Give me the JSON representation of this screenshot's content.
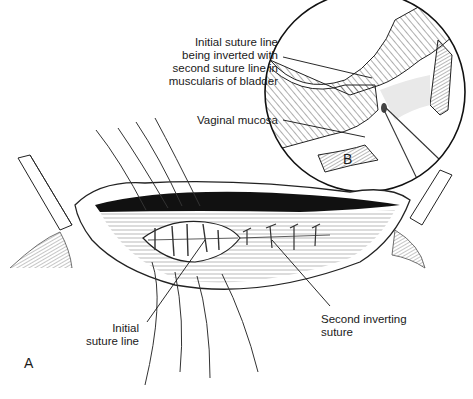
{
  "figure": {
    "panels": [
      {
        "id": "A",
        "label": "A"
      },
      {
        "id": "B",
        "label": "B"
      }
    ],
    "annotations": {
      "inverted_line": "Initial suture line\nbeing inverted with\nsecond suture line in\nmuscularis of bladder",
      "vaginal_mucosa": "Vaginal mucosa",
      "initial_suture": "Initial\nsuture line",
      "second_inverting": "Second inverting\nsuture"
    },
    "colors": {
      "ink": "#1a1a1a",
      "background": "#ffffff"
    }
  }
}
